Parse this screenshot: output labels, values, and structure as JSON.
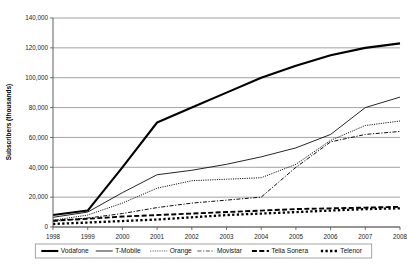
{
  "chart_data": {
    "type": "line",
    "title": "",
    "xlabel": "",
    "ylabel": "Subscribers (thousands)",
    "grid": true,
    "legend_position": "bottom",
    "x": [
      1998,
      1999,
      2000,
      2001,
      2002,
      2003,
      2004,
      2005,
      2006,
      2007,
      2008
    ],
    "xtick_labels": [
      "1998",
      "1999",
      "2000",
      "2001",
      "2002",
      "2003",
      "2004",
      "2005",
      "2006",
      "2007",
      "2008"
    ],
    "ylim": [
      0,
      140000
    ],
    "ytick_values": [
      0,
      20000,
      40000,
      60000,
      80000,
      100000,
      120000,
      140000
    ],
    "ytick_labels": [
      "0",
      "20,000",
      "40,000",
      "60,000",
      "80,000",
      "100,000",
      "120,000",
      "140,000"
    ],
    "series": [
      {
        "name": "Vodafone",
        "style": "solid-thick",
        "color": "#000000",
        "values": [
          8000,
          11000,
          40000,
          70000,
          80000,
          90000,
          100000,
          108000,
          115000,
          120000,
          123000
        ]
      },
      {
        "name": "T-Mobile",
        "style": "solid-thin",
        "color": "#000000",
        "values": [
          6500,
          10000,
          23000,
          35000,
          38000,
          42000,
          47000,
          53000,
          62000,
          80000,
          87000
        ]
      },
      {
        "name": "Orange",
        "style": "dotted",
        "color": "#4d4d4d",
        "values": [
          4500,
          8000,
          16000,
          26000,
          31000,
          32000,
          33000,
          42000,
          58000,
          68000,
          71000
        ]
      },
      {
        "name": "Movistar",
        "style": "dash-dot",
        "color": "#4d4d4d",
        "values": [
          4000,
          6000,
          9000,
          13000,
          16000,
          18000,
          20000,
          40000,
          57000,
          62000,
          64000
        ]
      },
      {
        "name": "Telia Sonera",
        "style": "long-dash",
        "color": "#000000",
        "values": [
          4200,
          5500,
          7000,
          8000,
          9000,
          10000,
          11000,
          12000,
          12500,
          13000,
          13500
        ]
      },
      {
        "name": "Telenor",
        "style": "square-dash",
        "color": "#000000",
        "values": [
          2000,
          3000,
          4000,
          5000,
          6500,
          8000,
          9000,
          10000,
          11000,
          12000,
          12500
        ]
      }
    ]
  },
  "legend": {
    "items": [
      {
        "label": "Vodafone"
      },
      {
        "label": "T-Mobile"
      },
      {
        "label": "Orange"
      },
      {
        "label": "Movistar"
      },
      {
        "label": "Telia Sonera"
      },
      {
        "label": "Telenor"
      }
    ]
  }
}
